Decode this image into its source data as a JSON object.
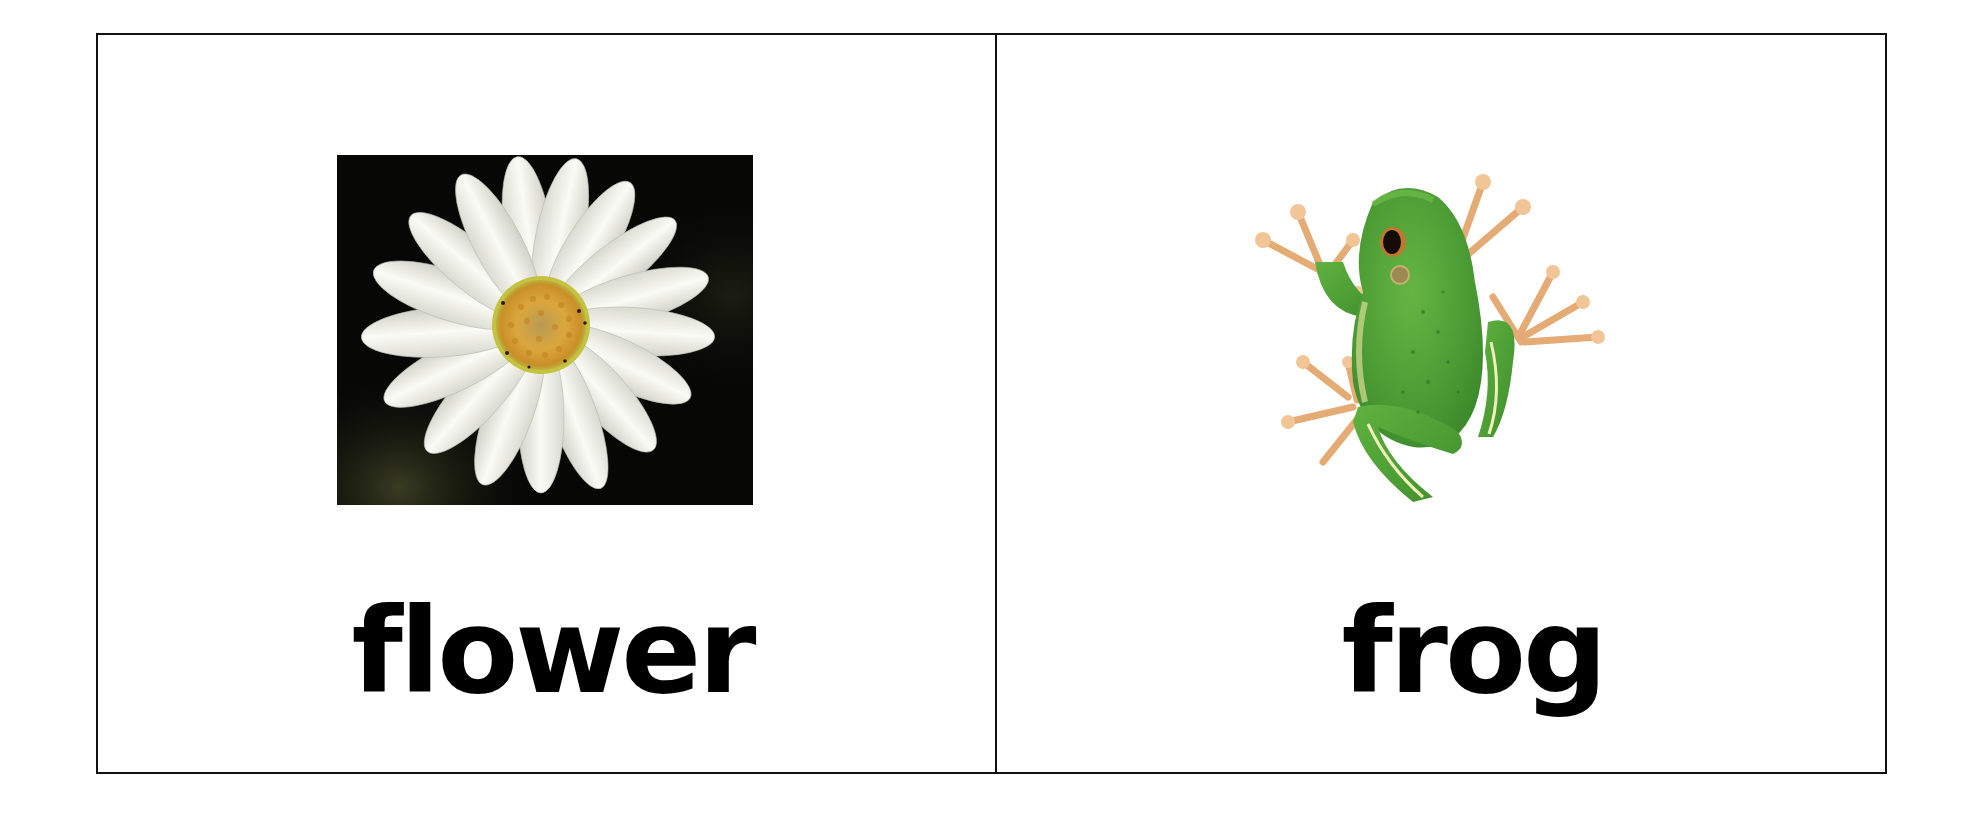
{
  "cards": [
    {
      "word": "flower",
      "image": {
        "subject": "white daisy on dark background",
        "icon": "daisy-photo"
      },
      "colors": {
        "background": "#070806",
        "petal": "#f4f4ee",
        "center": "#d9a33a"
      }
    },
    {
      "word": "frog",
      "image": {
        "subject": "green tree frog on white background",
        "icon": "frog-photo"
      },
      "colors": {
        "body": "#4fa33a",
        "toes": "#e9b27a",
        "eye": "#1a1208"
      }
    }
  ],
  "style": {
    "border_color": "#111111",
    "text_color": "#000000"
  }
}
